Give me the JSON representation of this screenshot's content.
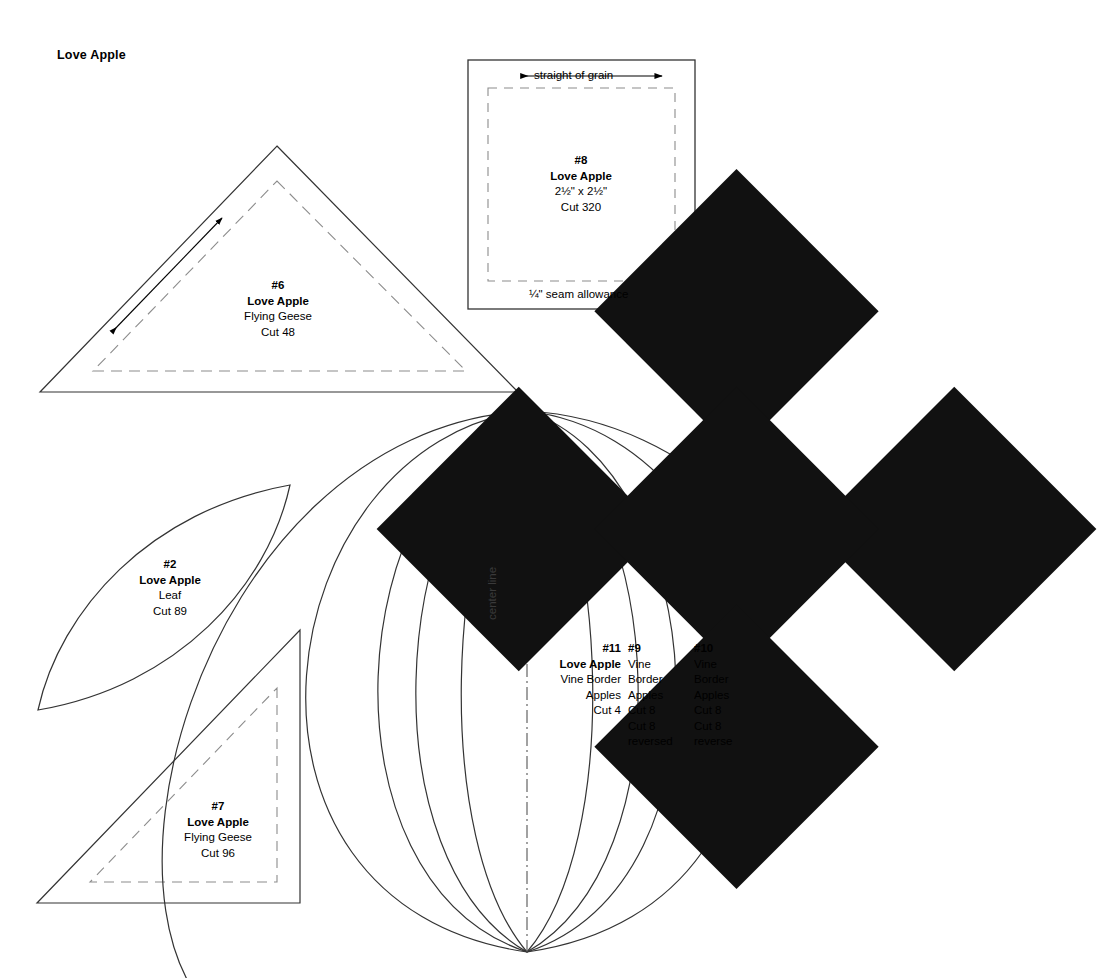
{
  "sheet": {
    "title": "Love Apple",
    "ornament_icon": "four-diamond-cluster"
  },
  "templates": [
    {
      "id": "piece-6",
      "shape": "triangle",
      "number": "#6",
      "pattern": "Love Apple",
      "unit": "Flying Geese",
      "cut": "Cut 48",
      "has_seam_line": true,
      "has_grain_arrow": true
    },
    {
      "id": "piece-8",
      "shape": "square",
      "number": "#8",
      "pattern": "Love Apple",
      "size": "2½\" x 2½\"",
      "cut": "Cut 320",
      "grain_label": "straight of grain",
      "seam_label": "¼\" seam allowance",
      "has_seam_line": true
    },
    {
      "id": "piece-2",
      "shape": "leaf",
      "number": "#2",
      "pattern": "Love Apple",
      "unit": "Leaf",
      "cut": "Cut 89",
      "has_seam_line": false
    },
    {
      "id": "piece-7",
      "shape": "right-triangle",
      "number": "#7",
      "pattern": "Love Apple",
      "unit": "Flying Geese",
      "cut": "Cut 96",
      "has_seam_line": true
    },
    {
      "id": "piece-11",
      "shape": "apple-segment",
      "number": "#11",
      "pattern": "Love Apple",
      "unit_line1": "Vine Border",
      "unit_line2": "Apples",
      "cut": "Cut 4"
    },
    {
      "id": "piece-9",
      "shape": "apple-segment",
      "number": "#9",
      "unit_line1": "Vine",
      "unit_line2": "Border",
      "unit_line3": "Apples",
      "cut": "Cut 8",
      "cut_reversed_line1": "Cut 8",
      "cut_reversed_line2": "reversed"
    },
    {
      "id": "piece-10",
      "shape": "apple-segment",
      "number": "#10",
      "unit_line1": "Vine",
      "unit_line2": "Border",
      "unit_line3": "Apples",
      "cut": "Cut 8",
      "cut_reversed_line1": "Cut 8",
      "cut_reversed_line2": "reverse"
    }
  ],
  "annotations": {
    "center_line": "center line"
  },
  "colors": {
    "ink": "#000000",
    "cut_line": "#333333",
    "seam_line": "#8c8c8c",
    "paper": "#ffffff"
  }
}
